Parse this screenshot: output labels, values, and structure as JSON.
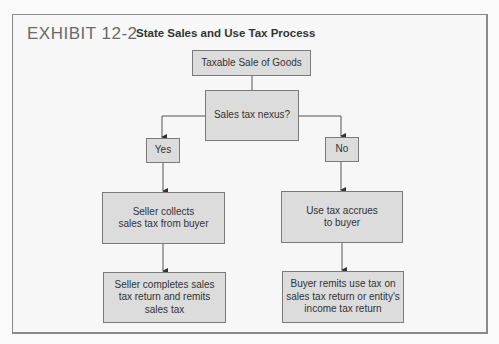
{
  "exhibit": {
    "label": "EXHIBIT 12-2",
    "title": "State Sales and Use Tax Process"
  },
  "flowchart": {
    "start": "Taxable Sale of Goods",
    "decision": "Sales tax nexus?",
    "branches": {
      "yes": {
        "label": "Yes",
        "step1": "Seller collects sales tax from buyer",
        "step1_lines": [
          "Seller collects",
          "sales tax from buyer"
        ],
        "step2": "Seller completes sales tax return and remits sales tax",
        "step2_lines": [
          "Seller completes sales",
          "tax return and remits",
          "sales tax"
        ]
      },
      "no": {
        "label": "No",
        "step1": "Use tax accrues to buyer",
        "step1_lines": [
          "Use tax accrues",
          "to buyer"
        ],
        "step2": "Buyer remits use tax on sales tax return or entity's income tax return",
        "step2_lines": [
          "Buyer remits use tax on",
          "sales tax return or entity's",
          "income tax return"
        ]
      }
    }
  },
  "colors": {
    "box_fill": "#dcdcdc",
    "box_border": "#7a7a7a",
    "line": "#555555",
    "exhibit_label": "#6a6a6a"
  }
}
